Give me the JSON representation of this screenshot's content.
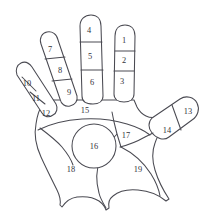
{
  "diagram": {
    "view": "palmar",
    "background_color": "#ffffff",
    "line_color": "#4a4a52",
    "label_color": "#33333a",
    "zone_count": 19,
    "zones": [
      {
        "id": "zone-1",
        "label": "1",
        "region": "index-finger-distal-phalanx",
        "x": 124,
        "y": 41
      },
      {
        "id": "zone-2",
        "label": "2",
        "region": "index-finger-middle-phalanx",
        "x": 124,
        "y": 61
      },
      {
        "id": "zone-3",
        "label": "3",
        "region": "index-finger-proximal-phalanx",
        "x": 122,
        "y": 81
      },
      {
        "id": "zone-4",
        "label": "4",
        "region": "middle-finger-distal-phalanx",
        "x": 89,
        "y": 31
      },
      {
        "id": "zone-5",
        "label": "5",
        "region": "middle-finger-middle-phalanx",
        "x": 90,
        "y": 57
      },
      {
        "id": "zone-6",
        "label": "6",
        "region": "middle-finger-proximal-phalanx",
        "x": 92,
        "y": 81
      },
      {
        "id": "zone-7",
        "label": "7",
        "region": "ring-finger-distal-phalanx",
        "x": 50,
        "y": 50
      },
      {
        "id": "zone-8",
        "label": "8",
        "region": "ring-finger-middle-phalanx",
        "x": 60,
        "y": 70
      },
      {
        "id": "zone-9",
        "label": "9",
        "region": "ring-finger-proximal-phalanx",
        "x": 68,
        "y": 92
      },
      {
        "id": "zone-10",
        "label": "10",
        "region": "little-finger-distal-phalanx",
        "x": 26,
        "y": 84
      },
      {
        "id": "zone-11",
        "label": "11",
        "region": "little-finger-middle-phalanx",
        "x": 35,
        "y": 99
      },
      {
        "id": "zone-12",
        "label": "12",
        "region": "little-finger-proximal-phalanx",
        "x": 45,
        "y": 114
      },
      {
        "id": "zone-13",
        "label": "13",
        "region": "thumb-distal-phalanx",
        "x": 188,
        "y": 113
      },
      {
        "id": "zone-14",
        "label": "14",
        "region": "thumb-proximal-phalanx",
        "x": 168,
        "y": 131
      },
      {
        "id": "zone-15",
        "label": "15",
        "region": "distal-palm-band",
        "x": 85,
        "y": 111
      },
      {
        "id": "zone-16",
        "label": "16",
        "region": "central-palm-circle",
        "x": 94,
        "y": 146
      },
      {
        "id": "zone-17",
        "label": "17",
        "region": "mid-palm-wedge",
        "x": 126,
        "y": 136
      },
      {
        "id": "zone-18",
        "label": "18",
        "region": "hypothenar-eminence",
        "x": 71,
        "y": 170
      },
      {
        "id": "zone-19",
        "label": "19",
        "region": "thenar-eminence",
        "x": 138,
        "y": 170
      }
    ]
  }
}
